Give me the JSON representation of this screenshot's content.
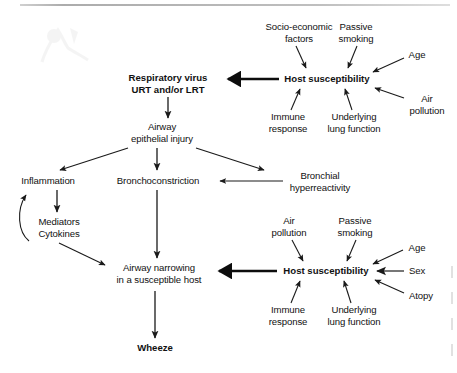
{
  "figure": {
    "title": "",
    "type": "flow-diagram",
    "domain": "respiratory medicine pathway"
  },
  "nodes": {
    "respiratory_virus": {
      "line1": "Respiratory virus",
      "line2": "URT and/or LRT"
    },
    "host_susceptibility_top": {
      "label": "Host susceptibility"
    },
    "socio_economic": {
      "line1": "Socio-economic",
      "line2": "factors"
    },
    "passive_smoking_top": {
      "line1": "Passive",
      "line2": "smoking"
    },
    "age_top": {
      "label": "Age"
    },
    "air_pollution_top": {
      "line1": "Air",
      "line2": "pollution"
    },
    "immune_response_top": {
      "line1": "Immune",
      "line2": "response"
    },
    "underlying_lung_top": {
      "line1": "Underlying",
      "line2": "lung function"
    },
    "airway_epithelial_injury": {
      "line1": "Airway",
      "line2": "epithelial injury"
    },
    "inflammation": {
      "label": "Inflammation"
    },
    "bronchoconstriction": {
      "label": "Bronchoconstriction"
    },
    "bronchial_hyperreactivity": {
      "line1": "Bronchial",
      "line2": "hyperreactivity"
    },
    "mediators_cytokines": {
      "line1": "Mediators",
      "line2": "Cytokines"
    },
    "airway_narrowing": {
      "line1": "Airway narrowing",
      "line2": "in a susceptible host"
    },
    "host_susceptibility_bottom": {
      "label": "Host susceptibility"
    },
    "air_pollution_bottom": {
      "line1": "Air",
      "line2": "pollution"
    },
    "passive_smoking_bottom": {
      "line1": "Passive",
      "line2": "smoking"
    },
    "age_bottom": {
      "label": "Age"
    },
    "sex": {
      "label": "Sex"
    },
    "atopy": {
      "label": "Atopy"
    },
    "immune_response_bottom": {
      "line1": "Immune",
      "line2": "response"
    },
    "underlying_lung_bottom": {
      "line1": "Underlying",
      "line2": "lung function"
    },
    "wheeze": {
      "label": "Wheeze"
    }
  },
  "edges": [
    {
      "from": "host_susceptibility_top",
      "to": "respiratory_virus",
      "weight": "thick"
    },
    {
      "from": "socio_economic",
      "to": "host_susceptibility_top",
      "weight": "thin"
    },
    {
      "from": "passive_smoking_top",
      "to": "host_susceptibility_top",
      "weight": "thin"
    },
    {
      "from": "age_top",
      "to": "host_susceptibility_top",
      "weight": "thin"
    },
    {
      "from": "air_pollution_top",
      "to": "host_susceptibility_top",
      "weight": "thin"
    },
    {
      "from": "immune_response_top",
      "to": "host_susceptibility_top",
      "weight": "thin"
    },
    {
      "from": "underlying_lung_top",
      "to": "host_susceptibility_top",
      "weight": "thin"
    },
    {
      "from": "respiratory_virus",
      "to": "airway_epithelial_injury",
      "weight": "thin"
    },
    {
      "from": "airway_epithelial_injury",
      "to": "inflammation",
      "weight": "thin"
    },
    {
      "from": "airway_epithelial_injury",
      "to": "bronchoconstriction",
      "weight": "thin"
    },
    {
      "from": "airway_epithelial_injury",
      "to": "bronchial_hyperreactivity",
      "weight": "thin"
    },
    {
      "from": "bronchial_hyperreactivity",
      "to": "bronchoconstriction",
      "weight": "thin"
    },
    {
      "from": "inflammation",
      "to": "mediators_cytokines",
      "weight": "thin"
    },
    {
      "from": "mediators_cytokines",
      "to": "inflammation",
      "weight": "curved"
    },
    {
      "from": "mediators_cytokines",
      "to": "airway_narrowing",
      "weight": "thin"
    },
    {
      "from": "bronchoconstriction",
      "to": "airway_narrowing",
      "weight": "thin"
    },
    {
      "from": "host_susceptibility_bottom",
      "to": "airway_narrowing",
      "weight": "thick"
    },
    {
      "from": "air_pollution_bottom",
      "to": "host_susceptibility_bottom",
      "weight": "thin"
    },
    {
      "from": "passive_smoking_bottom",
      "to": "host_susceptibility_bottom",
      "weight": "thin"
    },
    {
      "from": "age_bottom",
      "to": "host_susceptibility_bottom",
      "weight": "thin"
    },
    {
      "from": "sex",
      "to": "host_susceptibility_bottom",
      "weight": "thin"
    },
    {
      "from": "atopy",
      "to": "host_susceptibility_bottom",
      "weight": "thin"
    },
    {
      "from": "immune_response_bottom",
      "to": "host_susceptibility_bottom",
      "weight": "thin"
    },
    {
      "from": "underlying_lung_bottom",
      "to": "host_susceptibility_bottom",
      "weight": "thin"
    },
    {
      "from": "airway_narrowing",
      "to": "wheeze",
      "weight": "thin"
    }
  ],
  "colors": {
    "text": "#111111",
    "arrow": "#1a1a1a",
    "background": "#ffffff",
    "rule": "#a8a8a8"
  }
}
